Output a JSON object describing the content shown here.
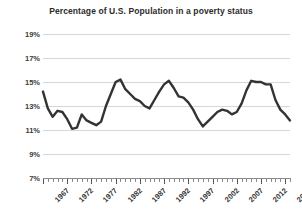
{
  "chart_data": {
    "type": "line",
    "title": "Percentage of U.S. Population in a poverty status",
    "xlabel": "",
    "ylabel": "",
    "ylim": [
      7,
      19
    ],
    "ytick_step": 2,
    "ytick_labels": [
      "19%",
      "17%",
      "15%",
      "13%",
      "11%",
      "9%",
      "7%"
    ],
    "ytick_values": [
      19,
      17,
      15,
      13,
      11,
      9,
      7
    ],
    "xlim": [
      1967,
      2018
    ],
    "xtick_labels": [
      "1967",
      "1972",
      "1977",
      "1982",
      "1987",
      "1992",
      "1997",
      "2002",
      "2007",
      "2012",
      "2017"
    ],
    "xtick_values": [
      1967,
      1972,
      1977,
      1982,
      1987,
      1992,
      1997,
      2002,
      2007,
      2012,
      2017
    ],
    "grid": "horizontal",
    "legend": "none",
    "series_name": "Poverty rate",
    "line_color": "#333333",
    "grid_color": "#d7d7d7",
    "x": [
      1967,
      1968,
      1969,
      1970,
      1971,
      1972,
      1973,
      1974,
      1975,
      1976,
      1977,
      1978,
      1979,
      1980,
      1981,
      1982,
      1983,
      1984,
      1985,
      1986,
      1987,
      1988,
      1989,
      1990,
      1991,
      1992,
      1993,
      1994,
      1995,
      1996,
      1997,
      1998,
      1999,
      2000,
      2001,
      2002,
      2003,
      2004,
      2005,
      2006,
      2007,
      2008,
      2009,
      2010,
      2011,
      2012,
      2013,
      2014,
      2015,
      2016,
      2017,
      2018
    ],
    "values": [
      14.2,
      12.8,
      12.1,
      12.6,
      12.5,
      11.9,
      11.1,
      11.2,
      12.3,
      11.8,
      11.6,
      11.4,
      11.7,
      13.0,
      14.0,
      15.0,
      15.2,
      14.4,
      14.0,
      13.6,
      13.4,
      13.0,
      12.8,
      13.5,
      14.2,
      14.8,
      15.1,
      14.5,
      13.8,
      13.7,
      13.3,
      12.7,
      11.9,
      11.3,
      11.7,
      12.1,
      12.5,
      12.7,
      12.6,
      12.3,
      12.5,
      13.2,
      14.3,
      15.1,
      15.0,
      15.0,
      14.8,
      14.8,
      13.5,
      12.7,
      12.3,
      11.8
    ]
  },
  "title": "Percentage of U.S. Population in a poverty status"
}
